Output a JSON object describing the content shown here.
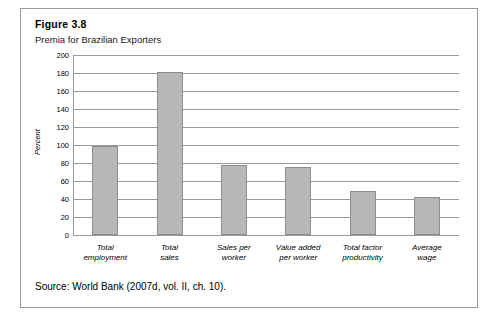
{
  "figure": {
    "number": "Figure 3.8",
    "title": "Premia for Brazilian Exporters",
    "source": "Source: World Bank (2007d, vol. II, ch. 10)."
  },
  "chart_data": {
    "type": "bar",
    "title": "Premia for Brazilian Exporters",
    "xlabel": "",
    "ylabel": "Percent",
    "ylim": [
      0,
      200
    ],
    "yticks": [
      0,
      20,
      40,
      60,
      80,
      100,
      120,
      140,
      160,
      180,
      200
    ],
    "grid": true,
    "legend": "none",
    "categories": [
      "Total\nemployment",
      "Total\nsales",
      "Sales per\nworker",
      "Value added\nper worker",
      "Total factor\nproductivity",
      "Average\nwage"
    ],
    "values": [
      99,
      181,
      78,
      76,
      49,
      42
    ]
  }
}
